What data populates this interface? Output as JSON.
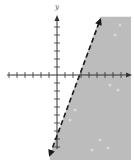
{
  "chart_data": {
    "type": "line",
    "title": "",
    "xlabel": "",
    "ylabel": "y",
    "grid": false,
    "axis": {
      "origin_px": [
        57,
        75
      ],
      "tick_spacing_px": 8,
      "x_ticks_negative": 6,
      "x_ticks_positive": 8,
      "y_ticks_positive": 6,
      "y_ticks_negative": 9,
      "xlim": [
        -6,
        9
      ],
      "ylim": [
        -10,
        7
      ]
    },
    "boundary_line": {
      "style": "dashed",
      "x_intercept": 3,
      "points": [
        [
          -0.9,
          -10
        ],
        [
          5.4,
          6.9
        ]
      ],
      "arrows": "both ends"
    },
    "shaded_region": "right of the dashed line (x greater side)",
    "colors": {
      "shade": "#bcbcbc",
      "axis": "#333333",
      "line": "#1a1a1a",
      "background": "#ffffff"
    }
  },
  "labels": {
    "y_axis": "y"
  }
}
